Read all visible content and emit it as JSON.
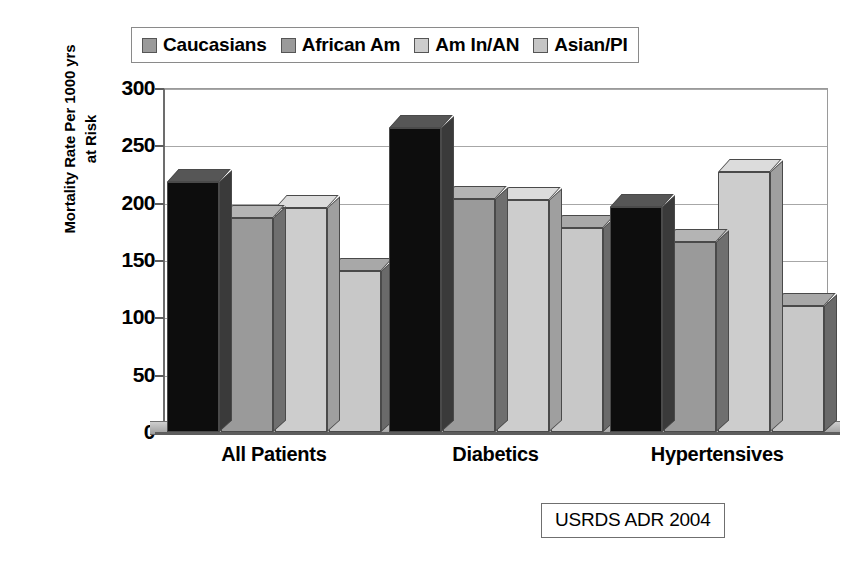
{
  "chart_data": {
    "type": "bar",
    "title": "",
    "subtitle": "",
    "xlabel": "",
    "ylabel": "Mortality Rate Per 1000 yrs at Risk",
    "ylabel_lines": [
      "Mortality Rate Per 1000 yrs",
      "at Risk"
    ],
    "ylim": [
      0,
      300
    ],
    "ytick_step": 50,
    "yticks": [
      "0",
      "50",
      "100",
      "150",
      "200",
      "250",
      "300"
    ],
    "grid": true,
    "grid_axis": "y",
    "legend_position": "top",
    "three_d": true,
    "categories": [
      "All Patients",
      "Diabetics",
      "Hypertensives"
    ],
    "series": [
      {
        "name": "Caucasians",
        "values": [
          218,
          265,
          196
        ]
      },
      {
        "name": "African Am",
        "values": [
          187,
          203,
          166
        ]
      },
      {
        "name": "Am In/AN",
        "values": [
          195,
          202,
          227
        ]
      },
      {
        "name": "Asian/PI",
        "values": [
          140,
          178,
          110
        ]
      }
    ],
    "series_colors": {
      "face": [
        "#0d0d0d",
        "#9a9a9a",
        "#cdcdcd",
        "#c8c8c8"
      ],
      "top": [
        "#565656",
        "#b4b4b4",
        "#dcdcdc",
        "#a8a8a8"
      ],
      "side": [
        "#3a3a3a",
        "#6f6f6f",
        "#9f9f9f",
        "#6a6a6a"
      ],
      "legend": [
        "#9a9a9a",
        "#9a9a9a",
        "#cdcdcd",
        "#c5c5c5"
      ]
    },
    "annotations": [
      {
        "name": "source-note",
        "text": "USRDS ADR 2004"
      }
    ]
  },
  "legend": {
    "items": [
      {
        "label": "Caucasians"
      },
      {
        "label": "African Am"
      },
      {
        "label": "Am In/AN"
      },
      {
        "label": "Asian/PI"
      }
    ]
  },
  "source": {
    "text": "USRDS ADR 2004"
  },
  "colors": {
    "axis": "#5d5d5d",
    "grid": "#a7a7a7",
    "bar_outline": "#4a4a4a",
    "background": "#ffffff",
    "text": "#000000"
  }
}
